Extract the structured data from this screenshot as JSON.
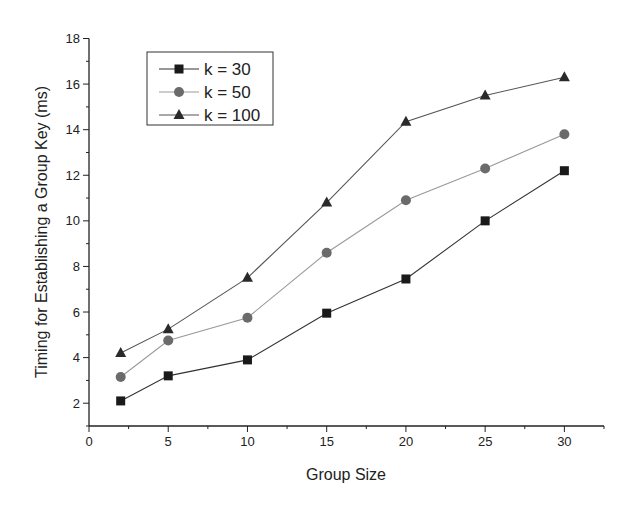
{
  "chart_data": {
    "type": "line",
    "title": "",
    "xlabel": "Group Size",
    "ylabel": "Timing for Establishing a Group Key (ms)",
    "x": [
      2,
      5,
      10,
      15,
      20,
      25,
      30
    ],
    "series": [
      {
        "name": "k = 30",
        "marker": "square",
        "color": "#1a1a1a",
        "line_color": "#333333",
        "values": [
          2.1,
          3.2,
          3.9,
          5.95,
          7.45,
          10.0,
          12.2
        ]
      },
      {
        "name": "k = 50",
        "marker": "circle",
        "color": "#6b6b6b",
        "line_color": "#9a9a9a",
        "values": [
          3.15,
          4.75,
          5.75,
          8.6,
          10.9,
          12.3,
          13.8
        ]
      },
      {
        "name": "k = 100",
        "marker": "triangle",
        "color": "#2a2a2a",
        "line_color": "#555555",
        "values": [
          4.2,
          5.25,
          7.5,
          10.8,
          14.35,
          15.5,
          16.3
        ]
      }
    ],
    "xlim": [
      0,
      32.5
    ],
    "ylim": [
      1,
      18
    ],
    "x_ticks": [
      0,
      5,
      10,
      15,
      20,
      25,
      30
    ],
    "x_tick_labels": [
      "0",
      "5",
      "10",
      "15",
      "20",
      "25",
      "30"
    ],
    "y_ticks": [
      2,
      4,
      6,
      8,
      10,
      12,
      14,
      16,
      18
    ],
    "y_tick_labels": [
      "2",
      "4",
      "6",
      "8",
      "10",
      "12",
      "14",
      "16",
      "18"
    ],
    "grid": false,
    "legend_position": "upper left (inside)"
  }
}
